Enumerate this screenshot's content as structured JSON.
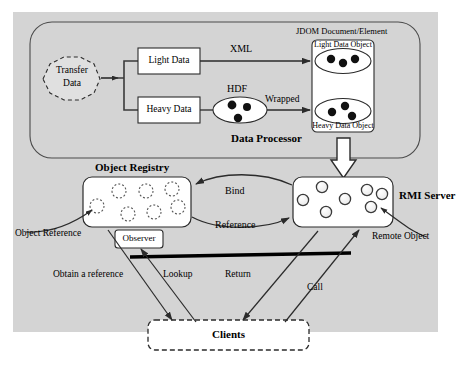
{
  "diagram": {
    "background_color": "#d4d4d4",
    "page_color": "#ffffff",
    "line_color": "#3a3a3a",
    "dot_color": "#111111",
    "box_fill": "#ffffff"
  },
  "data_processor": {
    "section_label": "Data Processor",
    "transfer_node": {
      "line1": "Transfer",
      "line2": "Data"
    },
    "light_data_box": "Light Data",
    "heavy_data_box": "Heavy Data",
    "hdf_label": "HDF",
    "xml_label": "XML",
    "wrapped_label": "Wrapped",
    "jdom_label": "JDOM Document/Element",
    "light_data_object": "Light Data Object",
    "heavy_data_object": "Heavy Data Object"
  },
  "registry": {
    "object_registry_title": "Object Registry",
    "rmi_server_title": "RMI Server",
    "observer_box": "Observer",
    "object_reference_label": "Object Reference",
    "remote_object_label": "Remote Object",
    "bind_label": "Bind",
    "reference_label": "Reference",
    "registry_circle_count": 7,
    "server_circle_count": 7
  },
  "clients": {
    "box_label": "Clients",
    "obtain_a_reference_label": "Obtain a reference",
    "lookup_label": "Lookup",
    "return_label": "Return",
    "call_label": "Call"
  }
}
